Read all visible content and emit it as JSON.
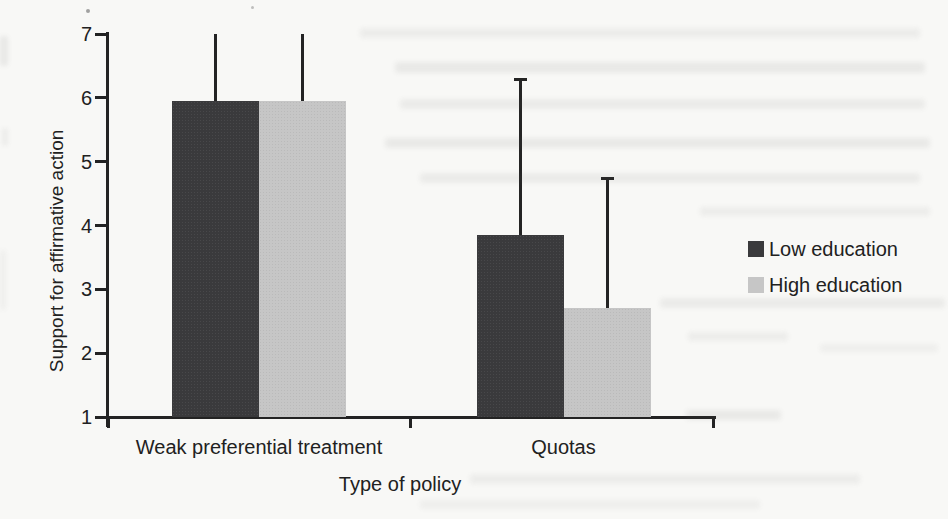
{
  "chart_data": {
    "type": "bar",
    "title": "",
    "categories": [
      "Weak preferential treatment",
      "Quotas"
    ],
    "series": [
      {
        "name": "Low education",
        "color": "#3a3a3c",
        "values": [
          5.95,
          3.85
        ],
        "error_top": [
          7.0,
          6.3
        ]
      },
      {
        "name": "High education",
        "color": "#c6c6c6",
        "values": [
          5.95,
          2.7
        ],
        "error_top": [
          7.0,
          4.75
        ]
      }
    ],
    "error_caps_by_category": [
      false,
      true
    ],
    "xlabel": "Type of policy",
    "ylabel": "Support for affirmative action",
    "ylim": [
      1,
      7
    ],
    "yticks": [
      1,
      2,
      3,
      4,
      5,
      6,
      7
    ],
    "legend_position": "right",
    "grid": false,
    "colors": {
      "axis": "#232323",
      "text": "#212121",
      "error_bar": "#242424",
      "paper": "#f8f8f6"
    }
  }
}
